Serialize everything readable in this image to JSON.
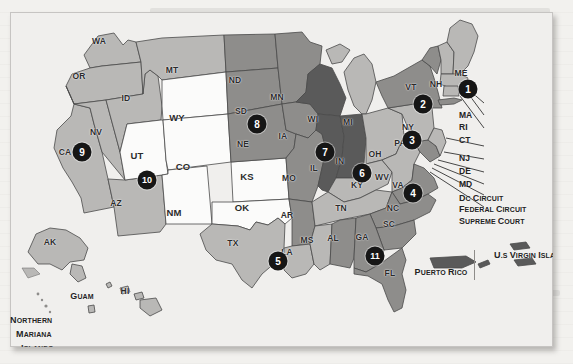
{
  "document": {
    "kind": "scanned-book-page",
    "figure_type": "map",
    "background_color": "#f2f1ee",
    "card_color": "#edeceb"
  },
  "map": {
    "title_visible": false,
    "palette": {
      "shade_light": "#d8d7d5",
      "shade_mid": "#b9b8b6",
      "shade_dark": "#8e8d8b",
      "shade_darkest": "#565656",
      "shade_white": "#fbfbfa",
      "outline": "#4a4a4a",
      "badge_fill": "#161616",
      "badge_text": "#ffffff",
      "water": "#f3f2f0"
    },
    "states": [
      {
        "abbr": "WA",
        "x": 99,
        "y": 41,
        "fill": "mid"
      },
      {
        "abbr": "OR",
        "x": 79,
        "y": 76,
        "fill": "mid"
      },
      {
        "abbr": "ID",
        "x": 126,
        "y": 98,
        "fill": "mid"
      },
      {
        "abbr": "MT",
        "x": 172,
        "y": 70,
        "fill": "mid"
      },
      {
        "abbr": "ND",
        "x": 235,
        "y": 80,
        "fill": "dark"
      },
      {
        "abbr": "SD",
        "x": 241,
        "y": 111,
        "fill": "dark"
      },
      {
        "abbr": "MN",
        "x": 277,
        "y": 97,
        "fill": "dark"
      },
      {
        "abbr": "WY",
        "x": 177,
        "y": 117,
        "fill": "white"
      },
      {
        "abbr": "NE",
        "x": 243,
        "y": 144,
        "fill": "dark"
      },
      {
        "abbr": "IA",
        "x": 283,
        "y": 136,
        "fill": "mid"
      },
      {
        "abbr": "WI",
        "x": 313,
        "y": 119,
        "fill": "darkest"
      },
      {
        "abbr": "MI",
        "x": 348,
        "y": 122,
        "fill": "mid"
      },
      {
        "abbr": "NV",
        "x": 96,
        "y": 132,
        "fill": "mid"
      },
      {
        "abbr": "CA",
        "x": 65,
        "y": 152,
        "fill": "mid"
      },
      {
        "abbr": "UT",
        "x": 137,
        "y": 155,
        "fill": "white"
      },
      {
        "abbr": "CO",
        "x": 183,
        "y": 166,
        "fill": "white"
      },
      {
        "abbr": "KS",
        "x": 247,
        "y": 176,
        "fill": "white"
      },
      {
        "abbr": "MO",
        "x": 289,
        "y": 178,
        "fill": "mid"
      },
      {
        "abbr": "IL",
        "x": 314,
        "y": 168,
        "fill": "darkest"
      },
      {
        "abbr": "IN",
        "x": 340,
        "y": 161,
        "fill": "darkest"
      },
      {
        "abbr": "OH",
        "x": 375,
        "y": 154,
        "fill": "mid"
      },
      {
        "abbr": "PA",
        "x": 400,
        "y": 143,
        "fill": "mid"
      },
      {
        "abbr": "NY",
        "x": 408,
        "y": 127,
        "fill": "dark"
      },
      {
        "abbr": "VT",
        "x": 411,
        "y": 87,
        "fill": "dark"
      },
      {
        "abbr": "NH",
        "x": 436,
        "y": 84,
        "fill": "mid"
      },
      {
        "abbr": "ME",
        "x": 461,
        "y": 73,
        "fill": "mid"
      },
      {
        "abbr": "AZ",
        "x": 116,
        "y": 203,
        "fill": "mid"
      },
      {
        "abbr": "NM",
        "x": 174,
        "y": 212,
        "fill": "white"
      },
      {
        "abbr": "OK",
        "x": 242,
        "y": 207,
        "fill": "white"
      },
      {
        "abbr": "AR",
        "x": 287,
        "y": 215,
        "fill": "mid"
      },
      {
        "abbr": "KY",
        "x": 357,
        "y": 185,
        "fill": "mid"
      },
      {
        "abbr": "WV",
        "x": 382,
        "y": 177,
        "fill": "mid"
      },
      {
        "abbr": "VA",
        "x": 398,
        "y": 185,
        "fill": "dark"
      },
      {
        "abbr": "TN",
        "x": 341,
        "y": 208,
        "fill": "mid"
      },
      {
        "abbr": "NC",
        "x": 393,
        "y": 208,
        "fill": "dark"
      },
      {
        "abbr": "SC",
        "x": 389,
        "y": 224,
        "fill": "dark"
      },
      {
        "abbr": "MS",
        "x": 307,
        "y": 240,
        "fill": "mid"
      },
      {
        "abbr": "AL",
        "x": 333,
        "y": 238,
        "fill": "dark"
      },
      {
        "abbr": "GA",
        "x": 362,
        "y": 237,
        "fill": "dark"
      },
      {
        "abbr": "LA",
        "x": 287,
        "y": 252,
        "fill": "mid"
      },
      {
        "abbr": "TX",
        "x": 233,
        "y": 243,
        "fill": "mid"
      },
      {
        "abbr": "FL",
        "x": 390,
        "y": 273,
        "fill": "dark"
      },
      {
        "abbr": "AK",
        "x": 50,
        "y": 242,
        "fill": "mid"
      },
      {
        "abbr": "HI",
        "x": 125,
        "y": 291,
        "fill": "mid"
      }
    ],
    "circuit_badges": [
      {
        "label": "1",
        "x": 468,
        "y": 89
      },
      {
        "label": "2",
        "x": 423,
        "y": 104
      },
      {
        "label": "3",
        "x": 412,
        "y": 140
      },
      {
        "label": "4",
        "x": 413,
        "y": 193
      },
      {
        "label": "5",
        "x": 278,
        "y": 261
      },
      {
        "label": "6",
        "x": 362,
        "y": 173
      },
      {
        "label": "7",
        "x": 325,
        "y": 152
      },
      {
        "label": "8",
        "x": 257,
        "y": 124
      },
      {
        "label": "9",
        "x": 82,
        "y": 152
      },
      {
        "label": "10",
        "x": 147,
        "y": 180
      },
      {
        "label": "11",
        "x": 375,
        "y": 256
      }
    ],
    "callouts": [
      {
        "label": "MA",
        "x": 459,
        "y": 115,
        "style": "plain"
      },
      {
        "label": "RI",
        "x": 459,
        "y": 127,
        "style": "plain"
      },
      {
        "label": "CT",
        "x": 459,
        "y": 140,
        "style": "plain"
      },
      {
        "label": "NJ",
        "x": 459,
        "y": 158,
        "style": "plain"
      },
      {
        "label": "DE",
        "x": 459,
        "y": 171,
        "style": "plain"
      },
      {
        "label": "MD",
        "x": 459,
        "y": 184,
        "style": "plain"
      },
      {
        "label": "DC Circuit",
        "x": 459,
        "y": 198,
        "style": "smallcaps"
      },
      {
        "label": "Federal Circuit",
        "x": 459,
        "y": 209,
        "style": "smallcaps"
      },
      {
        "label": "Supreme Court",
        "x": 459,
        "y": 221,
        "style": "smallcaps"
      }
    ],
    "territories": [
      {
        "label": "Puerto Rico",
        "x": 441,
        "y": 267,
        "align": "center"
      },
      {
        "label": "U.S Virgin Islands",
        "x": 494,
        "y": 250,
        "align": "left"
      },
      {
        "label": "Guam",
        "x": 82,
        "y": 291,
        "align": "center"
      },
      {
        "label": "Northern",
        "x": 10,
        "y": 315,
        "align": "left"
      },
      {
        "label": "Mariana",
        "x": 16,
        "y": 329,
        "align": "left"
      },
      {
        "label": "Islands",
        "x": 21,
        "y": 343,
        "align": "left"
      }
    ]
  }
}
